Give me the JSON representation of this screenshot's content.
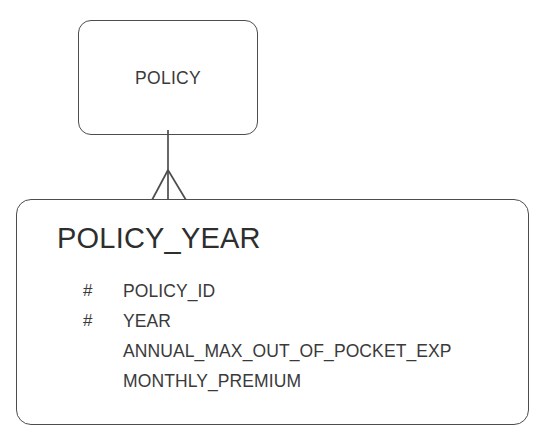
{
  "diagram": {
    "type": "entity-relationship-diagram",
    "notation": "crows-foot",
    "background_color": "#ffffff",
    "line_color": "#4d4d4f",
    "text_color": "#3a3a3a"
  },
  "entities": [
    {
      "id": "policy",
      "title": "POLICY",
      "attributes": []
    },
    {
      "id": "policy_year",
      "title": "POLICY_YEAR",
      "attributes": [
        {
          "marker": "#",
          "name": "POLICY_ID"
        },
        {
          "marker": "#",
          "name": "YEAR"
        },
        {
          "marker": "",
          "name": "ANNUAL_MAX_OUT_OF_POCKET_EXP"
        },
        {
          "marker": "",
          "name": "MONTHLY_PREMIUM"
        }
      ]
    }
  ],
  "relationships": [
    {
      "id": "policy-to-policy-year",
      "from": "POLICY",
      "to": "POLICY_YEAR",
      "from_cardinality": "one",
      "to_cardinality": "many",
      "to_symbol": "crows-foot"
    }
  ]
}
